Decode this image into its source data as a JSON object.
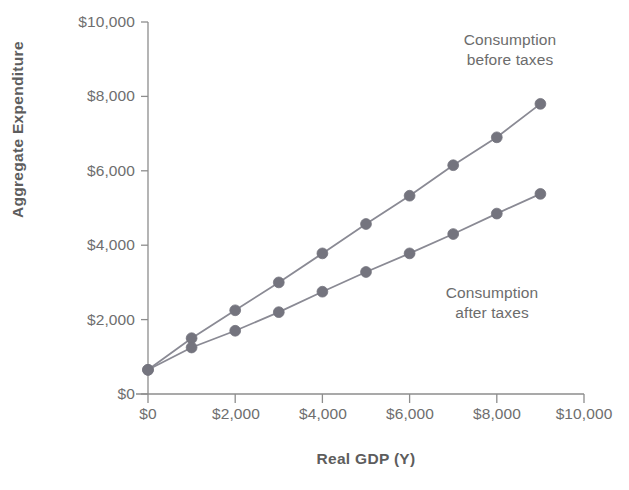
{
  "chart_data": {
    "type": "line",
    "title": "",
    "xlabel": "Real GDP (Y)",
    "ylabel": "Aggregate Expenditure",
    "xlim": [
      0,
      10000
    ],
    "ylim": [
      0,
      10000
    ],
    "grid": false,
    "legend_position": "inline-annotations",
    "x_ticks": [
      0,
      2000,
      4000,
      6000,
      8000,
      10000
    ],
    "x_tick_labels": [
      "$0",
      "$2,000",
      "$4,000",
      "$6,000",
      "$8,000",
      "$10,000"
    ],
    "y_ticks": [
      0,
      2000,
      4000,
      6000,
      8000,
      10000
    ],
    "y_tick_labels": [
      "$0",
      "$2,000",
      "$4,000",
      "$6,000",
      "$8,000",
      "$10,000"
    ],
    "x": [
      0,
      1000,
      2000,
      3000,
      4000,
      5000,
      6000,
      7000,
      8000,
      9000
    ],
    "series": [
      {
        "name": "Consumption before taxes",
        "values": [
          650,
          1500,
          2250,
          3000,
          3780,
          4570,
          5330,
          6150,
          6900,
          7800
        ]
      },
      {
        "name": "Consumption after taxes",
        "values": [
          650,
          1250,
          1700,
          2200,
          2750,
          3280,
          3780,
          4300,
          4850,
          5380
        ]
      }
    ],
    "annotations": [
      {
        "text_line1": "Consumption",
        "text_line2": "before taxes"
      },
      {
        "text_line1": "Consumption",
        "text_line2": "after taxes"
      }
    ],
    "colors": {
      "line": "#8a8a94",
      "marker": "#74747e",
      "axis": "#8d8d8d",
      "text": "#6c6c6c"
    }
  },
  "axes": {
    "y_title": "Aggregate Expenditure",
    "x_title": "Real GDP (Y)"
  },
  "y_tick_labels": [
    "$10,000",
    "$8,000",
    "$6,000",
    "$4,000",
    "$2,000",
    "$0"
  ],
  "x_tick_labels": [
    "$0",
    "$2,000",
    "$4,000",
    "$6,000",
    "$8,000",
    "$10,000"
  ],
  "annotation_before": {
    "line1": "Consumption",
    "line2": "before taxes"
  },
  "annotation_after": {
    "line1": "Consumption",
    "line2": "after taxes"
  }
}
